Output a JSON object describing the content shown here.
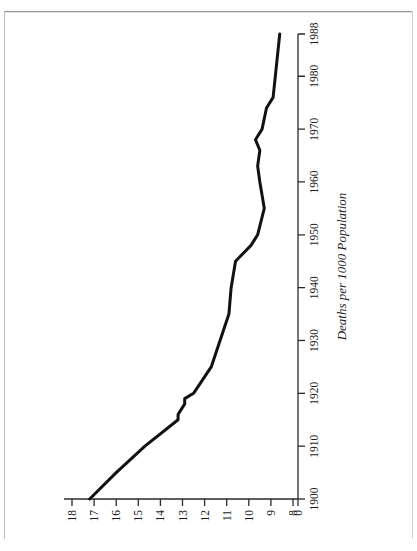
{
  "figure": {
    "orientation_note": "sideways",
    "rotation_degrees": -90
  },
  "chart_data": {
    "type": "line",
    "title": "",
    "subtitle": "",
    "xlabel": "",
    "ylabel": "Deaths per 1000 Population",
    "xlim": [
      1900,
      1988
    ],
    "ylim": [
      8,
      18
    ],
    "grid": false,
    "legend": null,
    "x_tick_labels": [
      "1900",
      "1910",
      "1920",
      "1930",
      "1940",
      "1950",
      "1960",
      "1970",
      "1980",
      "1988"
    ],
    "x_ticks": [
      1900,
      1910,
      1920,
      1930,
      1940,
      1950,
      1960,
      1970,
      1980,
      1988
    ],
    "y_tick_labels": [
      "18",
      "17",
      "16",
      "15",
      "14",
      "13",
      "12",
      "11",
      "10",
      "9",
      "8",
      "0"
    ],
    "y_ticks": [
      18,
      17,
      16,
      15,
      14,
      13,
      12,
      11,
      10,
      9,
      8,
      0
    ],
    "y_axis_break_label": "0",
    "series": [
      {
        "name": "Death rate",
        "x": [
          1900,
          1905,
          1910,
          1915,
          1916,
          1918,
          1919,
          1920,
          1925,
          1930,
          1935,
          1940,
          1945,
          1948,
          1950,
          1955,
          1960,
          1963,
          1966,
          1968,
          1970,
          1974,
          1976,
          1980,
          1984,
          1988
        ],
        "values": [
          17.2,
          16.0,
          14.7,
          13.2,
          13.2,
          12.9,
          12.9,
          12.5,
          11.7,
          11.3,
          10.9,
          10.8,
          10.6,
          9.9,
          9.6,
          9.3,
          9.5,
          9.6,
          9.5,
          9.7,
          9.4,
          9.2,
          8.9,
          8.8,
          8.7,
          8.6
        ]
      }
    ],
    "annotations": [],
    "line_color": "#111111",
    "line_width_px": 3,
    "axis_color": "#2a2a2a"
  },
  "axis": {
    "value_axis_title": "Deaths per 1000 Population"
  }
}
